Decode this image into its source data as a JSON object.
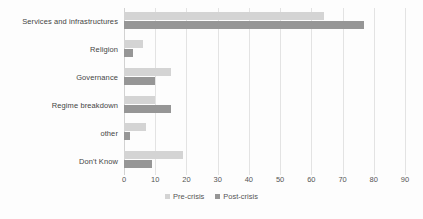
{
  "chart_data": {
    "type": "bar",
    "orientation": "horizontal",
    "title": "",
    "xlabel": "",
    "ylabel": "",
    "xlim": [
      0,
      90
    ],
    "xticks": [
      0,
      10,
      20,
      30,
      40,
      50,
      60,
      70,
      80,
      90
    ],
    "grid": true,
    "legend_position": "bottom",
    "categories": [
      "Services and infrastructures",
      "Religion",
      "Governance",
      "Regime breakdown",
      "other",
      "Don't Know"
    ],
    "series": [
      {
        "name": "Pre-crisis",
        "color": "#d4d4d4",
        "values": [
          64,
          6,
          15,
          10,
          7,
          19
        ]
      },
      {
        "name": "Post-crisis",
        "color": "#969696",
        "values": [
          77,
          3,
          10,
          15,
          2,
          9
        ]
      }
    ]
  }
}
